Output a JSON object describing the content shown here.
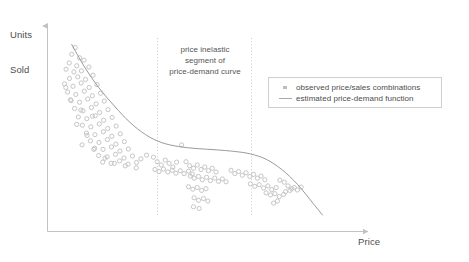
{
  "axes": {
    "y_label_line1": "Units",
    "y_label_line2": "Sold",
    "x_label": "Price"
  },
  "annotation": {
    "line1": "price inelastic",
    "line2": "segment of",
    "line3": "price-demand curve"
  },
  "legend": {
    "observed_label": "observed price/sales combinations",
    "estimated_label": "estimated price-demand function"
  },
  "colors": {
    "point": "#c6c6c6",
    "curve": "#9a9a9a",
    "axis": "#bfbfbf",
    "guide": "#cccccc",
    "text": "#4d4d4d",
    "legend_border": "#cfcfcf",
    "background": "#ffffff"
  },
  "chart_data": {
    "type": "scatter",
    "title": "",
    "xlabel": "Price",
    "ylabel": "Units Sold",
    "grid": false,
    "legend_position": "right",
    "axis_style": "arrow-axes, no tick labels",
    "xlim": [
      0,
      1
    ],
    "ylim": [
      0,
      1
    ],
    "annotations": [
      {
        "text": "price inelastic segment of price-demand curve",
        "x_range": [
          0.335,
          0.622
        ],
        "marker": "two vertical dotted guide lines"
      }
    ],
    "guide_lines": [
      {
        "type": "vertical-dotted",
        "x": 0.335
      },
      {
        "type": "vertical-dotted",
        "x": 0.622
      }
    ],
    "series": [
      {
        "name": "observed price/sales combinations",
        "type": "scatter",
        "marker": "circle",
        "color": "#c6c6c6",
        "points": [
          [
            0.09,
            0.895
          ],
          [
            0.079,
            0.862
          ],
          [
            0.104,
            0.845
          ],
          [
            0.071,
            0.82
          ],
          [
            0.095,
            0.806
          ],
          [
            0.118,
            0.833
          ],
          [
            0.061,
            0.789
          ],
          [
            0.086,
            0.776
          ],
          [
            0.11,
            0.781
          ],
          [
            0.134,
            0.8
          ],
          [
            0.072,
            0.744
          ],
          [
            0.098,
            0.752
          ],
          [
            0.123,
            0.739
          ],
          [
            0.147,
            0.76
          ],
          [
            0.056,
            0.718
          ],
          [
            0.083,
            0.706
          ],
          [
            0.109,
            0.722
          ],
          [
            0.135,
            0.7
          ],
          [
            0.16,
            0.714
          ],
          [
            0.066,
            0.678
          ],
          [
            0.092,
            0.666
          ],
          [
            0.119,
            0.682
          ],
          [
            0.145,
            0.66
          ],
          [
            0.171,
            0.672
          ],
          [
            0.077,
            0.636
          ],
          [
            0.104,
            0.628
          ],
          [
            0.13,
            0.644
          ],
          [
            0.157,
            0.62
          ],
          [
            0.183,
            0.634
          ],
          [
            0.088,
            0.598
          ],
          [
            0.115,
            0.586
          ],
          [
            0.142,
            0.602
          ],
          [
            0.168,
            0.578
          ],
          [
            0.195,
            0.592
          ],
          [
            0.1,
            0.556
          ],
          [
            0.127,
            0.548
          ],
          [
            0.154,
            0.562
          ],
          [
            0.181,
            0.54
          ],
          [
            0.208,
            0.554
          ],
          [
            0.113,
            0.516
          ],
          [
            0.14,
            0.508
          ],
          [
            0.167,
            0.522
          ],
          [
            0.194,
            0.5
          ],
          [
            0.221,
            0.512
          ],
          [
            0.126,
            0.478
          ],
          [
            0.153,
            0.47
          ],
          [
            0.18,
            0.484
          ],
          [
            0.207,
            0.462
          ],
          [
            0.234,
            0.474
          ],
          [
            0.139,
            0.44
          ],
          [
            0.166,
            0.432
          ],
          [
            0.193,
            0.446
          ],
          [
            0.22,
            0.424
          ],
          [
            0.247,
            0.436
          ],
          [
            0.152,
            0.404
          ],
          [
            0.179,
            0.398
          ],
          [
            0.206,
            0.41
          ],
          [
            0.233,
            0.39
          ],
          [
            0.26,
            0.4
          ],
          [
            0.165,
            0.368
          ],
          [
            0.192,
            0.362
          ],
          [
            0.219,
            0.374
          ],
          [
            0.246,
            0.356
          ],
          [
            0.273,
            0.366
          ],
          [
            0.178,
            0.336
          ],
          [
            0.205,
            0.33
          ],
          [
            0.232,
            0.342
          ],
          [
            0.259,
            0.326
          ],
          [
            0.286,
            0.334
          ],
          [
            0.06,
            0.7
          ],
          [
            0.075,
            0.64
          ],
          [
            0.108,
            0.59
          ],
          [
            0.145,
            0.56
          ],
          [
            0.095,
            0.52
          ],
          [
            0.128,
            0.466
          ],
          [
            0.112,
            0.42
          ],
          [
            0.15,
            0.398
          ],
          [
            0.185,
            0.355
          ],
          [
            0.215,
            0.33
          ],
          [
            0.25,
            0.318
          ],
          [
            0.285,
            0.308
          ],
          [
            0.3,
            0.352
          ],
          [
            0.318,
            0.37
          ],
          [
            0.34,
            0.36
          ],
          [
            0.352,
            0.338
          ],
          [
            0.365,
            0.322
          ],
          [
            0.378,
            0.346
          ],
          [
            0.39,
            0.33
          ],
          [
            0.402,
            0.312
          ],
          [
            0.414,
            0.336
          ],
          [
            0.345,
            0.3
          ],
          [
            0.358,
            0.29
          ],
          [
            0.372,
            0.302
          ],
          [
            0.386,
            0.288
          ],
          [
            0.4,
            0.296
          ],
          [
            0.412,
            0.282
          ],
          [
            0.426,
            0.294
          ],
          [
            0.438,
            0.28
          ],
          [
            0.452,
            0.292
          ],
          [
            0.464,
            0.278
          ],
          [
            0.43,
            0.42
          ],
          [
            0.444,
            0.338
          ],
          [
            0.456,
            0.318
          ],
          [
            0.468,
            0.306
          ],
          [
            0.48,
            0.322
          ],
          [
            0.492,
            0.3
          ],
          [
            0.504,
            0.312
          ],
          [
            0.516,
            0.294
          ],
          [
            0.528,
            0.306
          ],
          [
            0.54,
            0.288
          ],
          [
            0.458,
            0.268
          ],
          [
            0.47,
            0.258
          ],
          [
            0.484,
            0.266
          ],
          [
            0.496,
            0.25
          ],
          [
            0.51,
            0.262
          ],
          [
            0.522,
            0.246
          ],
          [
            0.536,
            0.258
          ],
          [
            0.548,
            0.242
          ],
          [
            0.56,
            0.254
          ],
          [
            0.572,
            0.24
          ],
          [
            0.452,
            0.216
          ],
          [
            0.466,
            0.204
          ],
          [
            0.48,
            0.212
          ],
          [
            0.494,
            0.198
          ],
          [
            0.508,
            0.206
          ],
          [
            0.47,
            0.162
          ],
          [
            0.484,
            0.15
          ],
          [
            0.5,
            0.158
          ],
          [
            0.514,
            0.146
          ],
          [
            0.468,
            0.118
          ],
          [
            0.486,
            0.11
          ],
          [
            0.588,
            0.296
          ],
          [
            0.6,
            0.28
          ],
          [
            0.612,
            0.29
          ],
          [
            0.624,
            0.272
          ],
          [
            0.636,
            0.284
          ],
          [
            0.648,
            0.266
          ],
          [
            0.66,
            0.276
          ],
          [
            0.672,
            0.258
          ],
          [
            0.684,
            0.268
          ],
          [
            0.696,
            0.25
          ],
          [
            0.65,
            0.23
          ],
          [
            0.664,
            0.218
          ],
          [
            0.678,
            0.226
          ],
          [
            0.692,
            0.21
          ],
          [
            0.706,
            0.22
          ],
          [
            0.718,
            0.202
          ],
          [
            0.732,
            0.212
          ],
          [
            0.7,
            0.186
          ],
          [
            0.714,
            0.176
          ],
          [
            0.728,
            0.182
          ],
          [
            0.742,
            0.168
          ],
          [
            0.756,
            0.178
          ],
          [
            0.744,
            0.248
          ],
          [
            0.758,
            0.238
          ],
          [
            0.77,
            0.22
          ],
          [
            0.782,
            0.206
          ],
          [
            0.736,
            0.146
          ],
          [
            0.762,
            0.192
          ],
          [
            0.776,
            0.198
          ],
          [
            0.79,
            0.212
          ],
          [
            0.8,
            0.2
          ],
          [
            0.812,
            0.214
          ],
          [
            0.724,
            0.136
          ]
        ]
      },
      {
        "name": "estimated price-demand function",
        "type": "line",
        "color": "#9a9a9a",
        "points": [
          [
            0.079,
            0.91
          ],
          [
            0.12,
            0.8
          ],
          [
            0.165,
            0.7
          ],
          [
            0.215,
            0.61
          ],
          [
            0.265,
            0.53
          ],
          [
            0.315,
            0.47
          ],
          [
            0.365,
            0.432
          ],
          [
            0.42,
            0.412
          ],
          [
            0.48,
            0.402
          ],
          [
            0.54,
            0.396
          ],
          [
            0.6,
            0.388
          ],
          [
            0.65,
            0.376
          ],
          [
            0.7,
            0.35
          ],
          [
            0.75,
            0.3
          ],
          [
            0.8,
            0.228
          ],
          [
            0.85,
            0.135
          ],
          [
            0.88,
            0.078
          ]
        ]
      }
    ]
  }
}
